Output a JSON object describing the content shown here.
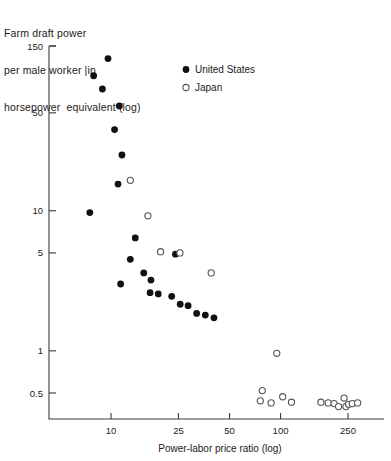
{
  "chart_data": {
    "type": "scatter",
    "title_lines": [
      "Farm draft power",
      "per male worker |in",
      "horsepower  equivalent (log)"
    ],
    "xlabel": "Power-labor price ratio (log)",
    "ylabel": "Farm draft power per male worker in horsepower equivalent (log)",
    "xscale": "log",
    "yscale": "log",
    "xlim": [
      6.0,
      330.0
    ],
    "ylim": [
      0.33,
      165.0
    ],
    "xticks": [
      10,
      25,
      50,
      100,
      250
    ],
    "xtick_labels": [
      "10",
      "25",
      "50",
      "100",
      "250"
    ],
    "yticks": [
      0.5,
      1,
      5,
      10,
      50,
      150
    ],
    "ytick_labels": [
      "0.5",
      "1",
      "5",
      "10",
      "50",
      "150"
    ],
    "grid": false,
    "legend_position": "upper-right",
    "series": [
      {
        "name": "United States",
        "marker": "filled-circle",
        "color": "#111111",
        "points": [
          [
            9.6,
            122.0
          ],
          [
            7.9,
            92.0
          ],
          [
            8.9,
            74.0
          ],
          [
            11.2,
            56.0
          ],
          [
            10.5,
            38.0
          ],
          [
            11.6,
            25.0
          ],
          [
            11.0,
            15.5
          ],
          [
            7.5,
            9.7
          ],
          [
            13.9,
            6.4
          ],
          [
            13.0,
            4.5
          ],
          [
            11.4,
            3.0
          ],
          [
            15.6,
            3.6
          ],
          [
            17.2,
            3.2
          ],
          [
            17.0,
            2.6
          ],
          [
            19.0,
            2.55
          ],
          [
            22.8,
            2.45
          ],
          [
            25.6,
            2.15
          ],
          [
            28.5,
            2.1
          ],
          [
            32.0,
            1.85
          ],
          [
            36.0,
            1.8
          ],
          [
            40.5,
            1.72
          ],
          [
            24.0,
            4.9
          ]
        ]
      },
      {
        "name": "Japan",
        "marker": "open-circle",
        "color": "#555555",
        "points": [
          [
            13.0,
            16.5
          ],
          [
            16.5,
            9.2
          ],
          [
            19.6,
            5.1
          ],
          [
            25.5,
            5.0
          ],
          [
            39.0,
            3.6
          ],
          [
            95.0,
            0.96
          ],
          [
            78.0,
            0.52
          ],
          [
            76.0,
            0.44
          ],
          [
            88.0,
            0.425
          ],
          [
            103.0,
            0.47
          ],
          [
            116.0,
            0.43
          ],
          [
            173.0,
            0.43
          ],
          [
            191.0,
            0.425
          ],
          [
            207.0,
            0.42
          ],
          [
            220.0,
            0.4
          ],
          [
            237.0,
            0.46
          ],
          [
            243.0,
            0.4
          ],
          [
            252.0,
            0.415
          ],
          [
            265.0,
            0.42
          ],
          [
            285.0,
            0.425
          ]
        ]
      }
    ]
  },
  "legend": {
    "entries": [
      {
        "label": "United States",
        "marker": "filled-circle"
      },
      {
        "label": "Japan",
        "marker": "open-circle"
      }
    ]
  },
  "colors": {
    "us_marker": "#111111",
    "jp_marker": "#555555",
    "axis": "#3a3a3a",
    "text": "#1a1a1a",
    "background": "#ffffff"
  }
}
